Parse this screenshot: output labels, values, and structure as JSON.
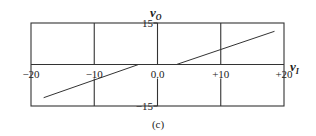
{
  "chart_data": {
    "type": "line",
    "title": "",
    "caption": "(c)",
    "xlabel": "v",
    "xlabel_sub": "I",
    "ylabel": "v",
    "ylabel_sub": "O",
    "xlim": [
      -20,
      20
    ],
    "ylim": [
      -15,
      15
    ],
    "x_ticks": [
      "−20",
      "−10",
      "0.0",
      "+10",
      "+20"
    ],
    "x_tick_values": [
      -20,
      -10,
      0,
      10,
      20
    ],
    "y_ticks": [
      "15",
      "−15"
    ],
    "y_tick_values": [
      15,
      -15
    ],
    "grid": true,
    "legend": null,
    "series": [
      {
        "name": "negative segment",
        "x": [
          -18,
          -3
        ],
        "y": [
          -12,
          0
        ]
      },
      {
        "name": "positive segment",
        "x": [
          3,
          18.5
        ],
        "y": [
          0,
          12
        ]
      }
    ],
    "colors": {
      "frame": "#333333",
      "line": "#333333",
      "text": "#222222"
    }
  }
}
